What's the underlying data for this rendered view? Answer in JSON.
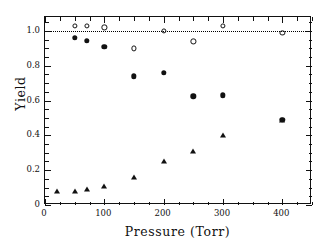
{
  "chart_data": {
    "type": "scatter",
    "title": "",
    "xlabel": "Pressure (Torr)",
    "ylabel": "Yield",
    "xlim": [
      0,
      450
    ],
    "ylim": [
      0,
      1.08
    ],
    "xticks": [
      0,
      100,
      200,
      300,
      400
    ],
    "xtick_labels": [
      "0",
      "100",
      "200",
      "300",
      "400"
    ],
    "xminor_step": 25,
    "yticks": [
      0,
      0.2,
      0.4,
      0.6,
      0.8,
      1.0
    ],
    "ytick_labels": [
      "0",
      "0.2",
      "0.4",
      "0.6",
      "0.8",
      "1.0"
    ],
    "yminor_step": 0.05,
    "grid": false,
    "legend": "none",
    "annotations": [
      {
        "type": "hline",
        "y": 1.0,
        "style": "dotted",
        "label": "unity yield reference"
      }
    ],
    "series": [
      {
        "name": "open-circles",
        "marker": "open-circle",
        "color": "#111111",
        "points": [
          {
            "x": 50,
            "y": 1.03
          },
          {
            "x": 70,
            "y": 1.03
          },
          {
            "x": 100,
            "y": 1.02
          },
          {
            "x": 150,
            "y": 0.9
          },
          {
            "x": 200,
            "y": 1.0
          },
          {
            "x": 250,
            "y": 0.94
          },
          {
            "x": 300,
            "y": 1.03
          },
          {
            "x": 400,
            "y": 0.99
          }
        ]
      },
      {
        "name": "filled-circles",
        "marker": "filled-circle",
        "color": "#111111",
        "points": [
          {
            "x": 50,
            "y": 0.96
          },
          {
            "x": 70,
            "y": 0.945
          },
          {
            "x": 100,
            "y": 0.91
          },
          {
            "x": 150,
            "y": 0.74
          },
          {
            "x": 200,
            "y": 0.76
          },
          {
            "x": 250,
            "y": 0.625
          },
          {
            "x": 300,
            "y": 0.63
          },
          {
            "x": 400,
            "y": 0.49
          }
        ]
      },
      {
        "name": "filled-triangles",
        "marker": "filled-triangle",
        "color": "#111111",
        "points": [
          {
            "x": 20,
            "y": 0.08
          },
          {
            "x": 50,
            "y": 0.08
          },
          {
            "x": 70,
            "y": 0.09
          },
          {
            "x": 100,
            "y": 0.11
          },
          {
            "x": 150,
            "y": 0.16
          },
          {
            "x": 200,
            "y": 0.25
          },
          {
            "x": 250,
            "y": 0.31
          },
          {
            "x": 300,
            "y": 0.4
          },
          {
            "x": 400,
            "y": 0.49
          }
        ]
      }
    ]
  }
}
